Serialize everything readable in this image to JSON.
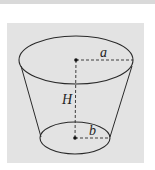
{
  "figure": {
    "type": "frustum-of-cone",
    "labels": {
      "top_radius": "a",
      "height": "H",
      "bottom_radius": "b"
    },
    "colors": {
      "panel": "#e3e3e3",
      "stroke": "#2a2a2a",
      "top_strip": "#d9d9d9"
    }
  }
}
